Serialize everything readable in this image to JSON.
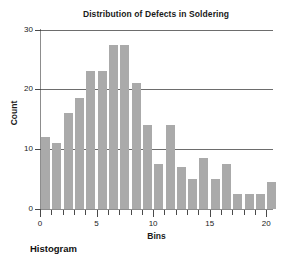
{
  "caption": "Histogram",
  "chart_data": {
    "type": "bar",
    "title": "Distribution of Defects in Soldering",
    "xlabel": "Bins",
    "ylabel": "Count",
    "xlim": [
      0,
      20.6
    ],
    "ylim": [
      0,
      30
    ],
    "grid": true,
    "grid_axis": "y",
    "legend": "none",
    "bar_color": "#aaaaaa",
    "axis_color": "#8d8d8d",
    "bar_width_bins": 1,
    "xticks": [
      0,
      1,
      2,
      3,
      4,
      5,
      6,
      7,
      8,
      9,
      10,
      11,
      12,
      13,
      14,
      15,
      16,
      17,
      18,
      19,
      20
    ],
    "xticklabels": [
      "0",
      "",
      "",
      "",
      "",
      "5",
      "",
      "",
      "",
      "",
      "10",
      "",
      "",
      "",
      "",
      "15",
      "",
      "",
      "",
      "",
      "20"
    ],
    "yticks": [
      0,
      10,
      20,
      30
    ],
    "yticklabels": [
      "0",
      "10",
      "20",
      "30"
    ],
    "bins": [
      {
        "left": 0,
        "right": 1,
        "center": 0.5,
        "value": 12
      },
      {
        "left": 1,
        "right": 2,
        "center": 1.5,
        "value": 11
      },
      {
        "left": 2,
        "right": 3,
        "center": 2.5,
        "value": 16
      },
      {
        "left": 3,
        "right": 4,
        "center": 3.5,
        "value": 18.5
      },
      {
        "left": 4,
        "right": 5,
        "center": 4.5,
        "value": 23
      },
      {
        "left": 5,
        "right": 6,
        "center": 5.5,
        "value": 23
      },
      {
        "left": 6,
        "right": 7,
        "center": 6.5,
        "value": 27.5
      },
      {
        "left": 7,
        "right": 8,
        "center": 7.5,
        "value": 27.5
      },
      {
        "left": 8,
        "right": 9,
        "center": 8.5,
        "value": 21
      },
      {
        "left": 9,
        "right": 10,
        "center": 9.5,
        "value": 14
      },
      {
        "left": 10,
        "right": 11,
        "center": 10.5,
        "value": 7.5
      },
      {
        "left": 11,
        "right": 12,
        "center": 11.5,
        "value": 14
      },
      {
        "left": 12,
        "right": 13,
        "center": 12.5,
        "value": 7
      },
      {
        "left": 13,
        "right": 14,
        "center": 13.5,
        "value": 5
      },
      {
        "left": 14,
        "right": 15,
        "center": 14.5,
        "value": 8.5
      },
      {
        "left": 15,
        "right": 16,
        "center": 15.5,
        "value": 5
      },
      {
        "left": 16,
        "right": 17,
        "center": 16.5,
        "value": 7.5
      },
      {
        "left": 17,
        "right": 18,
        "center": 17.5,
        "value": 2.5
      },
      {
        "left": 18,
        "right": 19,
        "center": 18.5,
        "value": 2.5
      },
      {
        "left": 19,
        "right": 20,
        "center": 19.5,
        "value": 2.5
      },
      {
        "left": 20,
        "right": 21,
        "center": 20.5,
        "value": 4.5
      }
    ]
  }
}
